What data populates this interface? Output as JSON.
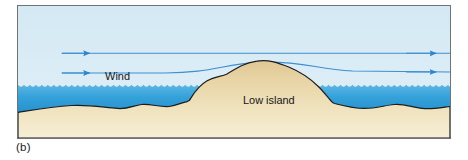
{
  "figure": {
    "caption": "(b)",
    "panel_border_color": "#6f7276",
    "background_color": "#ffffff"
  },
  "scene": {
    "title_hidden": "",
    "sky": {
      "name": "sky",
      "color_top": "#d6eaf4",
      "color_bottom": "#e4f2f8"
    },
    "water": {
      "name": "ocean-water",
      "color_top": "#2d9fd9",
      "color_bottom": "#1f7fc4",
      "surface_style": "wavy"
    },
    "land": {
      "name": "sand-seafloor",
      "color_top": "#e7d5a8",
      "color_bottom": "#f2e6c4",
      "outline_color": "#1d1d1b"
    },
    "labels": [
      {
        "id": "wind-label",
        "text": "Wind",
        "x": 100,
        "y": 75
      },
      {
        "id": "island-label",
        "text": "Low island",
        "x": 252,
        "y": 100
      }
    ],
    "wind_flow": {
      "name": "wind-streamlines",
      "line_color": "#3d8fd0",
      "arrow_color": "#2f86cd",
      "count": 2,
      "description": "Two horizontal streamlines deflected upward over the low island"
    }
  },
  "colors": {
    "accent_blue": "#2f86cd",
    "deep_water": "#1f7fc4",
    "sand": "#e7d5a8",
    "outline": "#1d1d1b"
  }
}
